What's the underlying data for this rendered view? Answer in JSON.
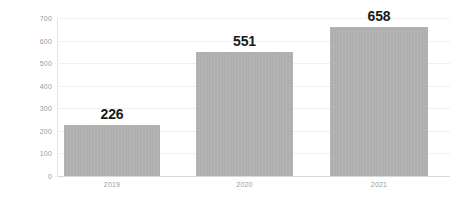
{
  "chart_data": {
    "type": "bar",
    "title": "",
    "subtitle": "",
    "xlabel": "",
    "ylabel": "",
    "categories": [
      "2019",
      "2020",
      "2021"
    ],
    "values": [
      226,
      551,
      658
    ],
    "data_labels": [
      "226",
      "551",
      "658"
    ],
    "ylim": [
      0,
      700
    ],
    "ytick_step": 100,
    "ytick_labels": [
      "700",
      "600",
      "500",
      "400",
      "300",
      "200",
      "100",
      "0"
    ],
    "ytick_values": [
      700,
      600,
      500,
      400,
      300,
      200,
      100,
      0
    ],
    "grid": true,
    "grid_axis": "y",
    "legend": false,
    "legend_position": "none",
    "series": [
      {
        "name": "",
        "values": [
          226,
          551,
          658
        ]
      }
    ],
    "colors": {
      "bar": "#b2b2b2",
      "gridline": "#f0f0f0",
      "axis": "#d8d8d8",
      "tick_text": "#9a9a9a",
      "value_text": "#1a1a1a",
      "background": "#ffffff"
    }
  }
}
